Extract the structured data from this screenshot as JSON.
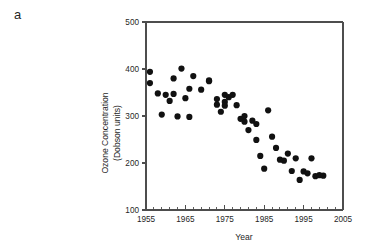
{
  "figure": {
    "panel_label": "a"
  },
  "chart_data": {
    "type": "scatter",
    "title": "",
    "xlabel": "Year",
    "ylabel": "Ozone Concentration (Dobson units)",
    "ylabel_line1": "Ozone Concentration",
    "ylabel_line2": "(Dobson units)",
    "xlim": [
      1955,
      2005
    ],
    "ylim": [
      100,
      500
    ],
    "xticks": [
      1955,
      1965,
      1975,
      1985,
      1995,
      2005
    ],
    "xtick_labels": [
      "1955",
      "1965",
      "1975",
      "1985",
      "1995",
      "2005"
    ],
    "x_minor_tick_step": 2,
    "yticks": [
      100,
      200,
      300,
      400,
      500
    ],
    "ytick_labels": [
      "100",
      "200",
      "300",
      "400",
      "500"
    ],
    "grid": false,
    "legend": false,
    "marker": "circle",
    "marker_color": "#111111",
    "marker_size": 3.1,
    "x": [
      1956,
      1957,
      1958,
      1959,
      1960,
      1961,
      1962,
      1963,
      1964,
      1965,
      1966,
      1967,
      1968,
      1969,
      1970,
      1971,
      1972,
      1973,
      1974,
      1975,
      1976,
      1977,
      1978,
      1979,
      1980,
      1981,
      1982,
      1983,
      1984,
      1985,
      1986,
      1987,
      1988,
      1989,
      1990,
      1991,
      1992,
      1993,
      1994,
      1995,
      1996,
      1997,
      1998,
      1999,
      2000,
      1958,
      1962,
      1967,
      1973,
      1976,
      1979,
      1984,
      1987,
      1991,
      1994,
      1997
    ],
    "y": [
      370,
      394,
      348,
      303,
      345,
      332,
      380,
      347,
      401,
      338,
      358,
      385,
      356,
      374,
      376,
      336,
      309,
      345,
      340,
      326,
      332,
      322,
      294,
      288,
      290,
      270,
      283,
      249,
      215,
      188,
      312,
      256,
      232,
      207,
      205,
      220,
      210,
      183,
      164,
      182,
      178,
      172,
      174,
      181,
      176,
      347,
      299,
      298,
      352,
      323,
      335,
      325,
      208,
      222,
      185,
      173
    ],
    "series_note": "Annual mean total ozone concentration, showing long-term decline"
  },
  "points": [
    {
      "year": 1956,
      "value": 370
    },
    {
      "year": 1956,
      "value": 394
    },
    {
      "year": 1958,
      "value": 348
    },
    {
      "year": 1959,
      "value": 303
    },
    {
      "year": 1960,
      "value": 345
    },
    {
      "year": 1961,
      "value": 332
    },
    {
      "year": 1962,
      "value": 380
    },
    {
      "year": 1962,
      "value": 347
    },
    {
      "year": 1963,
      "value": 299
    },
    {
      "year": 1964,
      "value": 401
    },
    {
      "year": 1965,
      "value": 338
    },
    {
      "year": 1966,
      "value": 358
    },
    {
      "year": 1966,
      "value": 298
    },
    {
      "year": 1967,
      "value": 385
    },
    {
      "year": 1969,
      "value": 356
    },
    {
      "year": 1971,
      "value": 374
    },
    {
      "year": 1971,
      "value": 376
    },
    {
      "year": 1973,
      "value": 336
    },
    {
      "year": 1973,
      "value": 324
    },
    {
      "year": 1974,
      "value": 309
    },
    {
      "year": 1975,
      "value": 345
    },
    {
      "year": 1975,
      "value": 330
    },
    {
      "year": 1975,
      "value": 322
    },
    {
      "year": 1976,
      "value": 340
    },
    {
      "year": 1977,
      "value": 345
    },
    {
      "year": 1978,
      "value": 323
    },
    {
      "year": 1979,
      "value": 294
    },
    {
      "year": 1980,
      "value": 288
    },
    {
      "year": 1980,
      "value": 300
    },
    {
      "year": 1981,
      "value": 270
    },
    {
      "year": 1982,
      "value": 290
    },
    {
      "year": 1983,
      "value": 249
    },
    {
      "year": 1983,
      "value": 283
    },
    {
      "year": 1984,
      "value": 215
    },
    {
      "year": 1985,
      "value": 188
    },
    {
      "year": 1986,
      "value": 312
    },
    {
      "year": 1987,
      "value": 256
    },
    {
      "year": 1988,
      "value": 232
    },
    {
      "year": 1989,
      "value": 207
    },
    {
      "year": 1990,
      "value": 205
    },
    {
      "year": 1991,
      "value": 220
    },
    {
      "year": 1992,
      "value": 183
    },
    {
      "year": 1993,
      "value": 210
    },
    {
      "year": 1994,
      "value": 164
    },
    {
      "year": 1995,
      "value": 182
    },
    {
      "year": 1996,
      "value": 178
    },
    {
      "year": 1997,
      "value": 210
    },
    {
      "year": 1998,
      "value": 172
    },
    {
      "year": 1999,
      "value": 174
    },
    {
      "year": 2000,
      "value": 173
    }
  ]
}
